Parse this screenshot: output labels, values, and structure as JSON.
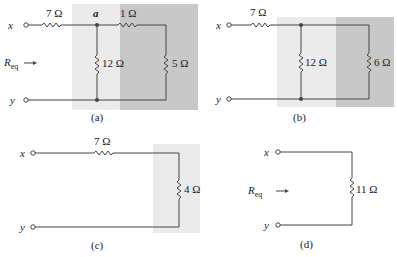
{
  "panels": {
    "a": {
      "caption": "(a)",
      "terminal_top": "x",
      "terminal_bottom": "y",
      "node_label": "a",
      "req_label": "R",
      "req_sub": "eq",
      "resistors": {
        "series": "7 Ω",
        "top_right": "1 Ω",
        "middle": "12 Ω",
        "right": "5 Ω"
      },
      "shade_light": "#ebebeb",
      "shade_dark": "#c8c8c8"
    },
    "b": {
      "caption": "(b)",
      "terminal_top": "x",
      "terminal_bottom": "y",
      "resistors": {
        "series": "7 Ω",
        "middle": "12 Ω",
        "right": "6 Ω"
      },
      "shade_light": "#ebebeb",
      "shade_dark": "#c8c8c8"
    },
    "c": {
      "caption": "(c)",
      "terminal_top": "x",
      "terminal_bottom": "y",
      "resistors": {
        "series": "7 Ω",
        "right": "4 Ω"
      },
      "shade_light": "#ebebeb"
    },
    "d": {
      "caption": "(d)",
      "terminal_top": "x",
      "terminal_bottom": "y",
      "req_label": "R",
      "req_sub": "eq",
      "resistors": {
        "right": "11 Ω"
      }
    }
  }
}
